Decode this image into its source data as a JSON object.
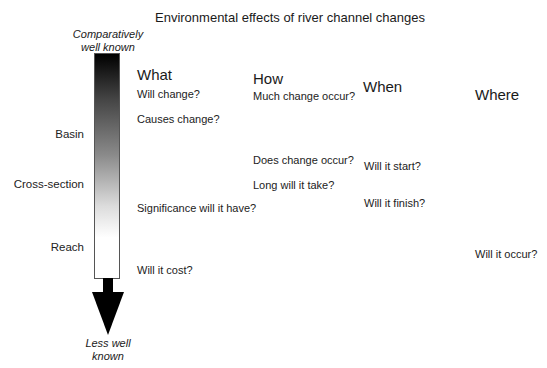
{
  "title": "Environmental effects of river channel changes",
  "scale": {
    "top_label_line1": "Comparatively",
    "top_label_line2": "well known",
    "bottom_label_line1": "Less well",
    "bottom_label_line2": "known",
    "gradient_colors": [
      "#000000",
      "#ffffff"
    ],
    "levels": [
      "Basin",
      "Cross-section",
      "Reach"
    ]
  },
  "columns": [
    {
      "heading": "What",
      "questions": [
        "Will change?",
        "Causes change?",
        "Significance will it have?",
        "Will it cost?"
      ]
    },
    {
      "heading": "How",
      "questions": [
        "Much change occur?",
        "Does change occur?",
        "Long will it take?"
      ]
    },
    {
      "heading": "When",
      "questions": [
        "Will it start?",
        "Will it finish?"
      ]
    },
    {
      "heading": "Where",
      "questions": [
        "Will it occur?"
      ]
    }
  ]
}
